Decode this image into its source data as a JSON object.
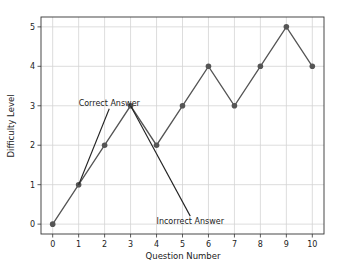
{
  "chart_data": {
    "type": "line",
    "title": "",
    "xlabel": "Question Number",
    "ylabel": "Difficulty Level",
    "x": [
      0,
      1,
      2,
      3,
      4,
      5,
      6,
      7,
      8,
      9,
      10
    ],
    "series": [
      {
        "name": "Difficulty Level",
        "values": [
          0,
          1,
          2,
          3,
          2,
          3,
          4,
          3,
          4,
          5,
          4
        ],
        "color": "#555555",
        "marker": "circle"
      }
    ],
    "xticks": [
      "0",
      "1",
      "2",
      "3",
      "4",
      "5",
      "6",
      "7",
      "8",
      "9",
      "10"
    ],
    "yticks": [
      "0",
      "1",
      "2",
      "3",
      "4",
      "5"
    ],
    "xlim": [
      -0.45,
      10.45
    ],
    "ylim": [
      -0.25,
      5.25
    ],
    "grid": true,
    "legend": null,
    "annotations": [
      {
        "text": "Correct Answer",
        "xy": [
          1,
          1
        ],
        "xytext": [
          1,
          3
        ],
        "arrow": true
      },
      {
        "text": "Incorrect Answer",
        "xy": [
          3,
          3
        ],
        "xytext": [
          4,
          0
        ],
        "arrow": true
      }
    ]
  }
}
